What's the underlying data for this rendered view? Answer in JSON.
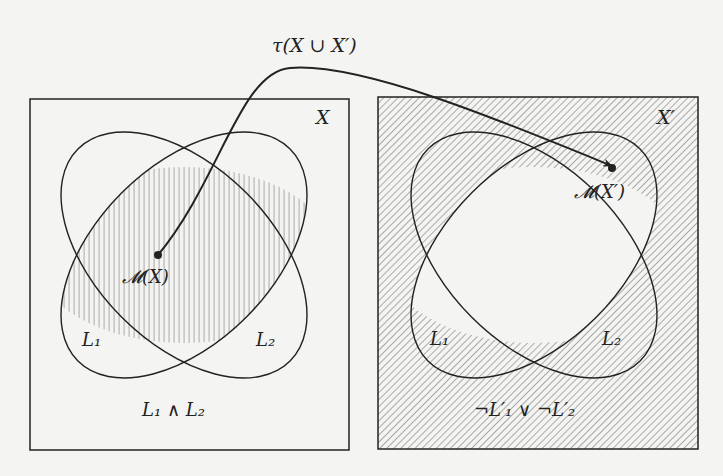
{
  "diagram": {
    "top_label": "τ(X ∪ X′)",
    "left_panel": {
      "set_label": "X",
      "point_label": "𝓜(X)",
      "ellipse_labels": [
        "L₁",
        "L₂"
      ],
      "region_label": "L₁ ∧ L₂",
      "shaded_region": "intersection of L1 and L2"
    },
    "right_panel": {
      "set_label": "X′",
      "point_label": "𝓜(X′)",
      "ellipse_labels": [
        "L₁",
        "L₂"
      ],
      "region_label": "¬L′₁ ∨ ¬L′₂",
      "shaded_region": "complement of intersection of L1 and L2"
    },
    "arrow": {
      "from": "𝓜(X)",
      "to": "𝓜(X′)"
    },
    "colors": {
      "ink": "#222222",
      "hatch": "#8a8a8a",
      "background": "#f4f4f2"
    }
  }
}
